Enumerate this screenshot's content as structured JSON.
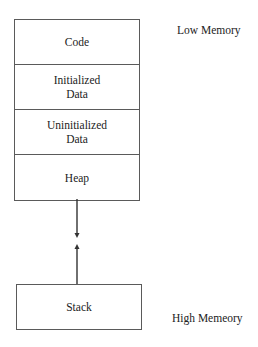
{
  "diagram": {
    "segments": [
      {
        "label": "Code"
      },
      {
        "label": "Initialized\nData"
      },
      {
        "label": "Uninitialized\nData"
      },
      {
        "label": "Heap"
      }
    ],
    "stack": {
      "label": "Stack"
    },
    "labels": {
      "low": "Low Memory",
      "high": "High Memeory"
    },
    "arrows": [
      {
        "from": "Heap",
        "direction": "down",
        "meaning": "heap grows toward higher addresses"
      },
      {
        "from": "Stack",
        "direction": "up",
        "meaning": "stack grows toward lower addresses"
      }
    ],
    "colors": {
      "border": "#5a5a5a",
      "text": "#222222",
      "arrow": "#333333"
    }
  }
}
